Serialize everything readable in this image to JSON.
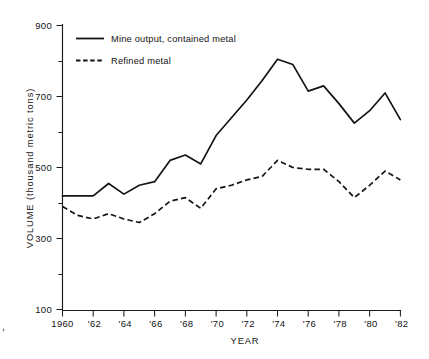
{
  "chart_data": {
    "type": "line",
    "title": "",
    "xlabel": "YEAR",
    "ylabel": "VOLUME (thousand metric tons)",
    "xlim": [
      1960,
      1982
    ],
    "ylim": [
      0,
      900
    ],
    "yticks_major": [
      900,
      700,
      500,
      300,
      100
    ],
    "yticks_minor": [
      800,
      600,
      400,
      200
    ],
    "xtick_labels": [
      "1960",
      "'62",
      "'64",
      "'66",
      "'68",
      "'70",
      "'72",
      "'74",
      "'76",
      "'78",
      "'80",
      "'82"
    ],
    "xtick_values": [
      1960,
      1962,
      1964,
      1966,
      1968,
      1970,
      1972,
      1974,
      1976,
      1978,
      1980,
      1982
    ],
    "grid": false,
    "legend_position": "top-left-inside",
    "x": [
      1960,
      1961,
      1962,
      1963,
      1964,
      1965,
      1966,
      1967,
      1968,
      1969,
      1970,
      1971,
      1972,
      1973,
      1974,
      1975,
      1976,
      1977,
      1978,
      1979,
      1980,
      1981,
      1982
    ],
    "series": [
      {
        "name": "Mine output, contained metal",
        "style": "solid",
        "values": [
          420,
          420,
          420,
          455,
          425,
          450,
          460,
          520,
          535,
          510,
          590,
          640,
          690,
          745,
          805,
          790,
          715,
          730,
          680,
          625,
          660,
          710,
          635
        ]
      },
      {
        "name": "Refined metal",
        "style": "dashed",
        "values": [
          390,
          365,
          355,
          370,
          355,
          345,
          370,
          405,
          415,
          385,
          440,
          450,
          465,
          475,
          520,
          500,
          495,
          495,
          460,
          415,
          450,
          490,
          465
        ]
      }
    ]
  },
  "legend": {
    "items": [
      {
        "label": "Mine output, contained metal",
        "style": "solid"
      },
      {
        "label": "Refined metal",
        "style": "dashed"
      }
    ]
  },
  "axes": {
    "y_title": "VOLUME (thousand metric tons)",
    "x_title": "YEAR",
    "y_labels": [
      "900",
      "700",
      "500",
      "300",
      "100"
    ],
    "x_labels": [
      "1960",
      "'62",
      "'64",
      "'66",
      "'68",
      "'70",
      "'72",
      "'74",
      "'76",
      "'78",
      "'80",
      "'82"
    ]
  },
  "margin_mark": {
    "text": ","
  },
  "colors": {
    "ink": "#141414",
    "background": "#ffffff"
  }
}
